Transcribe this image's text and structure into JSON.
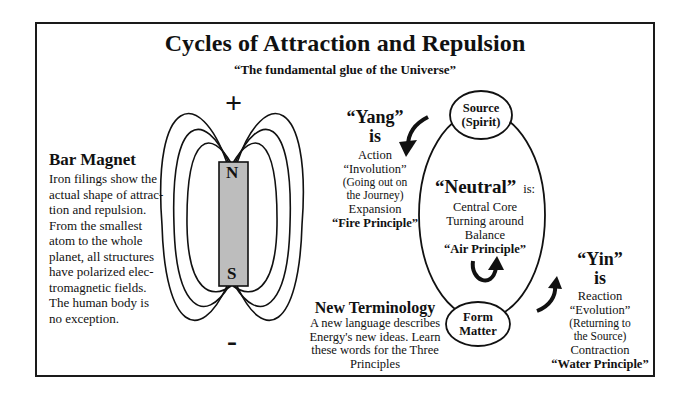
{
  "title": "Cycles of Attraction and Repulsion",
  "subtitle": "“The fundamental glue of the Universe”",
  "bar_magnet": {
    "heading": "Bar Magnet",
    "lines": [
      "Iron filings show the",
      "actual shape of attrac-",
      "tion and repulsion.",
      "From the smallest",
      "atom to the whole",
      "planet, all structures",
      "have polarized elec-",
      "tromagnetic fields.",
      "The human body is",
      "no exception."
    ],
    "plus_sign": "+",
    "minus_sign": "-",
    "north_label": "N",
    "south_label": "S",
    "magnet_fill": "#bdbdbd"
  },
  "yang": {
    "heading": "“Yang”",
    "is": "is",
    "lines": [
      "Action",
      "“Involution”",
      "(Going out on",
      "the Journey)",
      "Expansion"
    ],
    "principle": "“Fire Principle”"
  },
  "neutral": {
    "heading": "“Neutral”",
    "is": "is:",
    "lines": [
      "Central Core",
      "Turning around",
      "Balance"
    ],
    "principle": "“Air Principle”"
  },
  "yin": {
    "heading": "“Yin”",
    "is": "is",
    "lines": [
      "Reaction",
      "“Evolution”",
      "(Returning to",
      "the Source)",
      "Contraction"
    ],
    "principle": "“Water Principle”"
  },
  "source_node": {
    "line1": "Source",
    "line2": "(Spirit)"
  },
  "form_node": {
    "line1": "Form",
    "line2": "Matter"
  },
  "new_terminology": {
    "heading": "New Terminology",
    "lines": [
      "A new language describes",
      "Energy's new ideas. Learn",
      "these words for the Three",
      "Principles"
    ]
  }
}
